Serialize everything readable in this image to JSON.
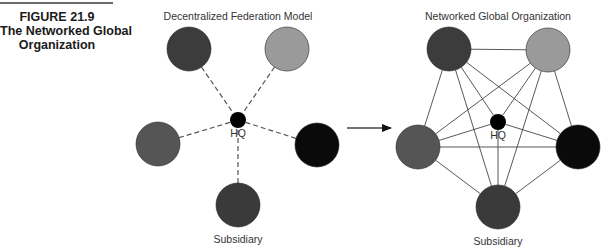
{
  "figure": {
    "number": "FIGURE 21.9",
    "title_line1": "The Networked Global",
    "title_line2": "Organization"
  },
  "left_diagram": {
    "title": "Decentralized Federation Model",
    "hub_label": "HQ",
    "node_label": "Subsidiary",
    "connection_style": "dashed",
    "hub": {
      "cx": 238,
      "cy": 120,
      "r": 8,
      "color": "#000000"
    },
    "nodes": [
      {
        "id": "top-left",
        "cx": 189,
        "cy": 49,
        "r": 22,
        "color": "#3c3c3c"
      },
      {
        "id": "top-right",
        "cx": 287,
        "cy": 49,
        "r": 22,
        "color": "#9a9a9a"
      },
      {
        "id": "mid-left",
        "cx": 158,
        "cy": 144,
        "r": 22,
        "color": "#555555"
      },
      {
        "id": "mid-right",
        "cx": 317,
        "cy": 145,
        "r": 22,
        "color": "#0a0a0a"
      },
      {
        "id": "bottom",
        "cx": 238,
        "cy": 205,
        "r": 22,
        "color": "#3a3a3a"
      }
    ]
  },
  "transition_arrow": {
    "from_x": 347,
    "to_x": 391,
    "y": 128
  },
  "right_diagram": {
    "title": "Networked Global Organization",
    "hub_label": "HQ",
    "node_label": "Subsidiary",
    "connection_style": "solid-full-mesh",
    "hub": {
      "cx": 498,
      "cy": 122,
      "r": 8,
      "color": "#000000"
    },
    "nodes": [
      {
        "id": "top-left",
        "cx": 449,
        "cy": 49,
        "r": 22,
        "color": "#3c3c3c"
      },
      {
        "id": "top-right",
        "cx": 548,
        "cy": 50,
        "r": 22,
        "color": "#9a9a9a"
      },
      {
        "id": "mid-left",
        "cx": 418,
        "cy": 147,
        "r": 22,
        "color": "#555555"
      },
      {
        "id": "mid-right",
        "cx": 578,
        "cy": 147,
        "r": 22,
        "color": "#0a0a0a"
      },
      {
        "id": "bottom",
        "cx": 498,
        "cy": 207,
        "r": 22,
        "color": "#3a3a3a"
      }
    ]
  }
}
